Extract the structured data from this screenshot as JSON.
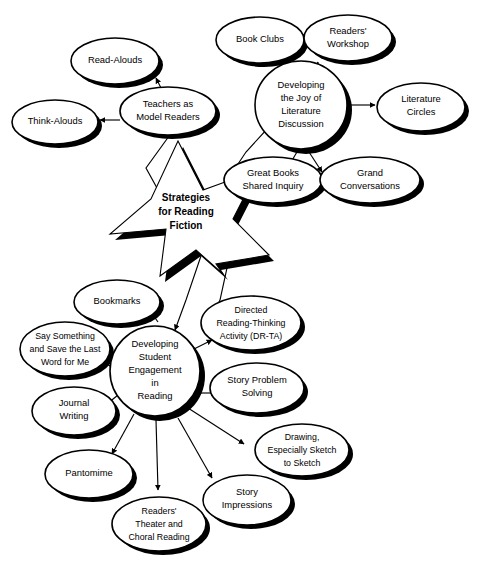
{
  "diagram": {
    "title": "Strategies for Reading Fiction",
    "type": "concept-map",
    "background_color": "#ffffff",
    "line_color": "#000000",
    "shadow_color": "#000000",
    "center": {
      "shape": "star",
      "lines": [
        "Strategies",
        "for Reading",
        "Fiction"
      ]
    },
    "clusters": [
      {
        "id": "teachers-as-model-readers",
        "hub": {
          "lines": [
            "Teachers as",
            "Model Readers"
          ]
        },
        "nodes": [
          {
            "id": "read-alouds",
            "lines": [
              "Read-Alouds"
            ]
          },
          {
            "id": "think-alouds",
            "lines": [
              "Think-Alouds"
            ]
          }
        ]
      },
      {
        "id": "developing-the-joy-of-literature-discussion",
        "hub": {
          "lines": [
            "Developing",
            "the Joy of",
            "Literature",
            "Discussion"
          ]
        },
        "nodes": [
          {
            "id": "book-clubs",
            "lines": [
              "Book Clubs"
            ]
          },
          {
            "id": "readers-workshop",
            "lines": [
              "Readers'",
              "Workshop"
            ]
          },
          {
            "id": "literature-circles",
            "lines": [
              "Literature",
              "Circles"
            ]
          },
          {
            "id": "great-books-shared-inquiry",
            "lines": [
              "Great Books",
              "Shared Inquiry"
            ]
          },
          {
            "id": "grand-conversations",
            "lines": [
              "Grand",
              "Conversations"
            ]
          }
        ]
      },
      {
        "id": "developing-student-engagement-in-reading",
        "hub": {
          "lines": [
            "Developing",
            "Student",
            "Engagement",
            "in",
            "Reading"
          ]
        },
        "nodes": [
          {
            "id": "bookmarks",
            "lines": [
              "Bookmarks"
            ]
          },
          {
            "id": "say-something-save-last-word",
            "lines": [
              "Say Something",
              "and Save the Last",
              "Word for Me"
            ]
          },
          {
            "id": "journal-writing",
            "lines": [
              "Journal",
              "Writing"
            ]
          },
          {
            "id": "pantomime",
            "lines": [
              "Pantomime"
            ]
          },
          {
            "id": "readers-theater-choral-reading",
            "lines": [
              "Readers'",
              "Theater and",
              "Choral Reading"
            ]
          },
          {
            "id": "story-impressions",
            "lines": [
              "Story",
              "Impressions"
            ]
          },
          {
            "id": "drawing-especially-sketch-to-sketch",
            "lines": [
              "Drawing,",
              "Especially Sketch",
              "to Sketch"
            ]
          },
          {
            "id": "story-problem-solving",
            "lines": [
              "Story Problem",
              "Solving"
            ]
          },
          {
            "id": "directed-reading-thinking-activity",
            "lines": [
              "Directed",
              "Reading-Thinking",
              "Activity (DR-TA)"
            ]
          }
        ]
      }
    ]
  }
}
